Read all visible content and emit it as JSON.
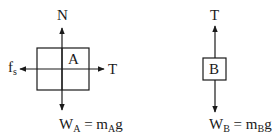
{
  "diagram": {
    "type": "free-body-diagrams",
    "block_a": {
      "label": "A",
      "forces": {
        "up": {
          "label": "N"
        },
        "left": {
          "label": "f",
          "subscript": "s"
        },
        "right": {
          "label": "T"
        },
        "down": {
          "label": "W",
          "subscript": "A",
          "equals": " = m",
          "equals_subscript": "A",
          "equals_tail": "g"
        }
      }
    },
    "block_b": {
      "label": "B",
      "forces": {
        "up": {
          "label": "T"
        },
        "down": {
          "label": "W",
          "subscript": "B",
          "equals": " = m",
          "equals_subscript": "B",
          "equals_tail": "g"
        }
      }
    },
    "colors": {
      "line": "#1a1a1a",
      "background": "#ffffff"
    }
  }
}
